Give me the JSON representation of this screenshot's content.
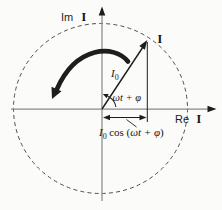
{
  "figure": {
    "colors": {
      "background": "#fbfbfa",
      "ink": "#1d1d1d",
      "axis": "#8a8a8a"
    },
    "axes": {
      "imaginary": {
        "prefix": "Im",
        "symbol": "I"
      },
      "real": {
        "prefix": "Re",
        "symbol": "I"
      }
    },
    "phasor": {
      "tip_label": "I",
      "magnitude": {
        "base": "I",
        "sub": "0"
      },
      "angle_label": "ωt + φ",
      "rotation_direction": "counterclockwise"
    },
    "projection": {
      "base": "I",
      "sub": "0",
      "fn": "cos (",
      "arg": "ωt + φ",
      "close": ")"
    }
  }
}
